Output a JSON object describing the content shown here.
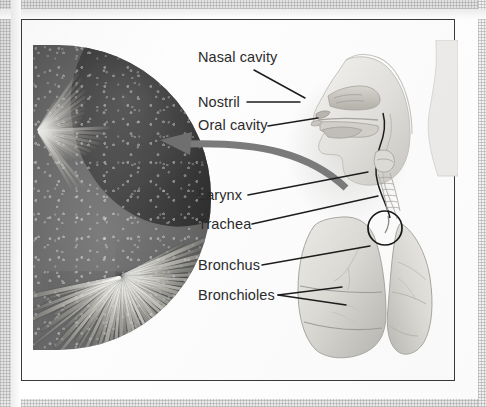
{
  "figure": {
    "type": "anatomical-diagram",
    "labels": [
      {
        "id": "nasal-cavity",
        "text": "Nasal cavity"
      },
      {
        "id": "nostril",
        "text": "Nostril"
      },
      {
        "id": "oral-cavity",
        "text": "Oral cavity"
      },
      {
        "id": "larynx",
        "text": "Larynx"
      },
      {
        "id": "trachea",
        "text": "Trachea"
      },
      {
        "id": "bronchus",
        "text": "Bronchus"
      },
      {
        "id": "bronchioles",
        "text": "Bronchioles"
      }
    ],
    "panels": [
      {
        "id": "micrograph",
        "content": "grayscale electron micrograph of cilia, circular crop"
      },
      {
        "id": "anatomy",
        "content": "grayscale sagittal head section and lungs"
      }
    ],
    "colors": {
      "label_text": "#2b2b2b",
      "leader_line": "#1d1d1d",
      "callout_arrow": "#7b7b7b",
      "frame_border": "#3a3a3a",
      "page_background": "#ffffff",
      "paper_margin": "#e3e3e3"
    }
  }
}
